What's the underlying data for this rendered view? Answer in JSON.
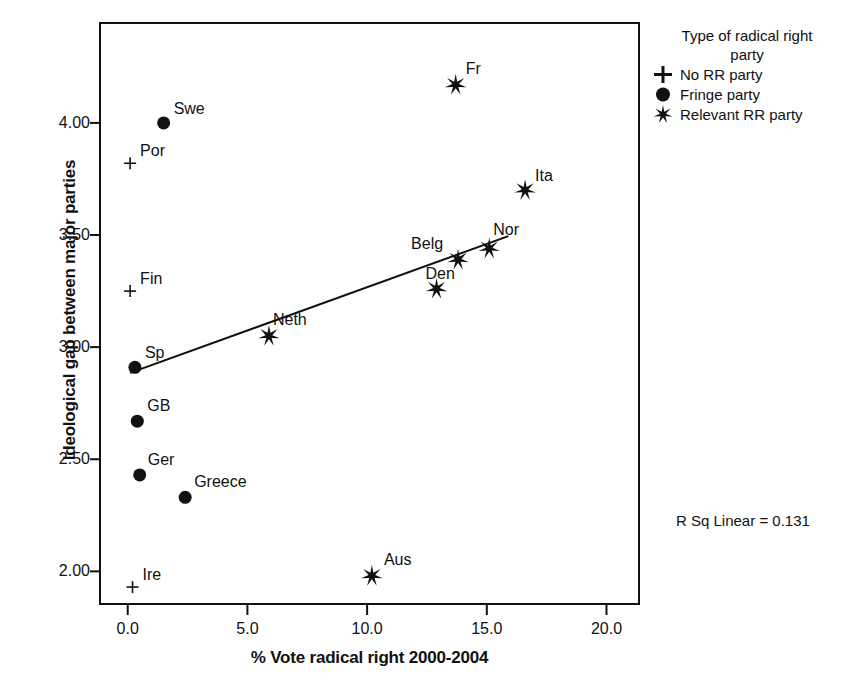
{
  "chart_data": {
    "type": "scatter",
    "title": "",
    "xlabel": "% Vote radical right 2000-2004",
    "ylabel": "Ideological gap between major parties",
    "xlim": [
      -1.2,
      21.4
    ],
    "ylim": [
      1.85,
      4.45
    ],
    "xticks": [
      "0.0",
      "5.0",
      "10.0",
      "15.0",
      "20.0"
    ],
    "xtick_values": [
      0.0,
      5.0,
      10.0,
      15.0,
      20.0
    ],
    "yticks": [
      "4.00",
      "3.50",
      "3.00",
      "2.50",
      "2.00"
    ],
    "ytick_values": [
      4.0,
      3.5,
      3.0,
      2.5,
      2.0
    ],
    "grid": false,
    "legend_position": "right",
    "annotation": "R Sq Linear = 0.131",
    "r_squared": 0.131,
    "fit_line": {
      "type": "linear",
      "x_start": 0.1,
      "y_start": 2.885,
      "x_end": 15.9,
      "y_end": 3.495
    },
    "series": [
      {
        "name": "No RR party",
        "marker": "plus",
        "points": [
          {
            "label": "Por",
            "x": 0.1,
            "y": 3.82,
            "label_dx": 10,
            "label_dy": -20
          },
          {
            "label": "Fin",
            "x": 0.1,
            "y": 3.25,
            "label_dx": 10,
            "label_dy": -20
          },
          {
            "label": "Ire",
            "x": 0.2,
            "y": 1.93,
            "label_dx": 10,
            "label_dy": -20
          }
        ]
      },
      {
        "name": "Fringe party",
        "marker": "dot",
        "points": [
          {
            "label": "Swe",
            "x": 1.5,
            "y": 4.0,
            "label_dx": 10,
            "label_dy": -22
          },
          {
            "label": "Sp",
            "x": 0.3,
            "y": 2.91,
            "label_dx": 10,
            "label_dy": -22
          },
          {
            "label": "GB",
            "x": 0.4,
            "y": 2.67,
            "label_dx": 10,
            "label_dy": -23
          },
          {
            "label": "Ger",
            "x": 0.5,
            "y": 2.43,
            "label_dx": 8,
            "label_dy": -23
          },
          {
            "label": "Greece",
            "x": 2.4,
            "y": 2.33,
            "label_dx": 9,
            "label_dy": -23
          }
        ]
      },
      {
        "name": "Relevant RR party",
        "marker": "star",
        "points": [
          {
            "label": "Fr",
            "x": 13.7,
            "y": 4.17,
            "label_dx": 10,
            "label_dy": -24
          },
          {
            "label": "Ita",
            "x": 16.6,
            "y": 3.7,
            "label_dx": 10,
            "label_dy": -22
          },
          {
            "label": "Nor",
            "x": 15.1,
            "y": 3.44,
            "label_dx": 4,
            "label_dy": -26
          },
          {
            "label": "Belg",
            "x": 13.8,
            "y": 3.39,
            "label_dx": -47,
            "label_dy": -24
          },
          {
            "label": "Den",
            "x": 12.9,
            "y": 3.26,
            "label_dx": -11,
            "label_dy": -23
          },
          {
            "label": "Neth",
            "x": 5.9,
            "y": 3.05,
            "label_dx": 4,
            "label_dy": -24
          },
          {
            "label": "Aus",
            "x": 10.2,
            "y": 1.98,
            "label_dx": 12,
            "label_dy": -24
          }
        ]
      }
    ]
  },
  "legend": {
    "title_line1": "Type of radical right",
    "title_line2": "party",
    "entries": [
      {
        "symbol": "plus-icon",
        "label": "No RR party"
      },
      {
        "symbol": "dot-icon",
        "label": "Fringe party"
      },
      {
        "symbol": "star-icon",
        "label": "Relevant RR party"
      }
    ]
  },
  "colors": {
    "ink": "#111111",
    "background": "#ffffff"
  }
}
